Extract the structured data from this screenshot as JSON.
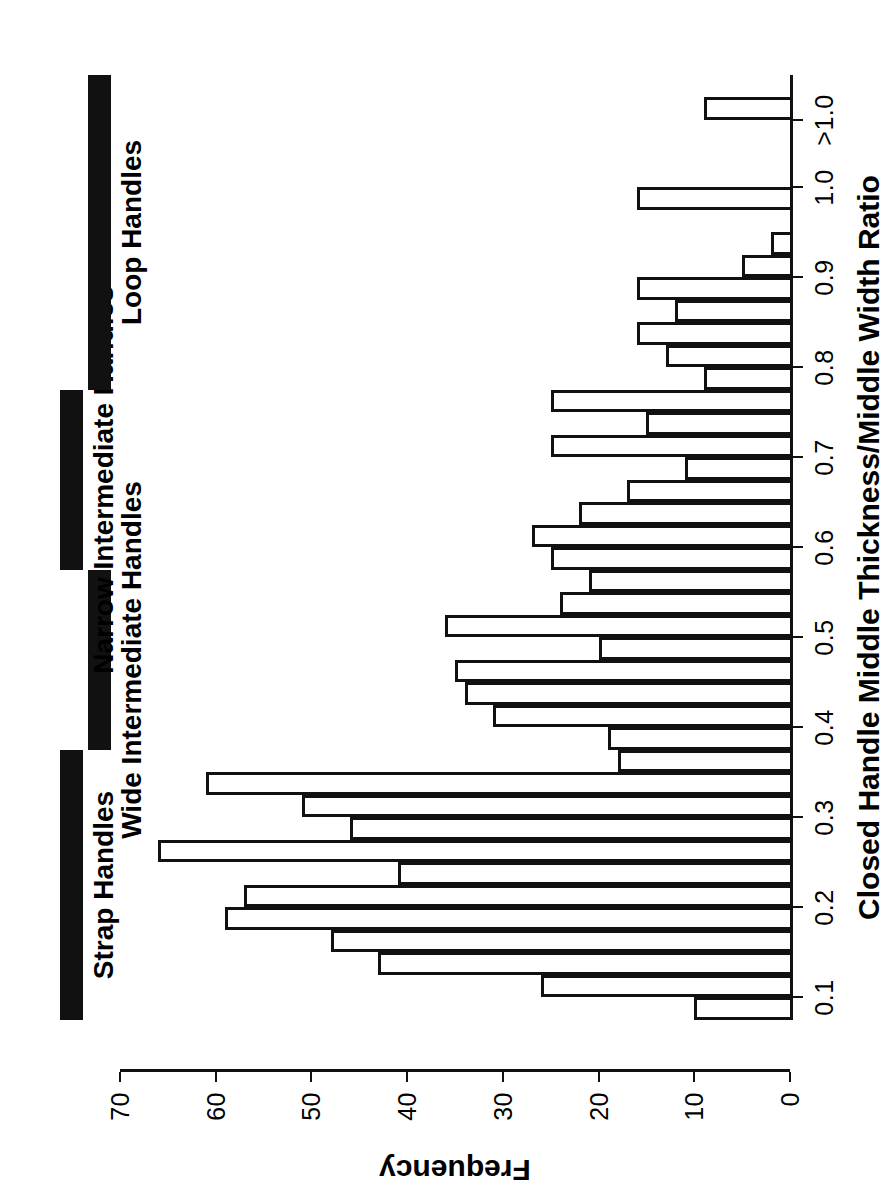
{
  "figure": {
    "kind": "histogram",
    "orientation": "rotated-90-ccw"
  },
  "axes": {
    "x_title": "Closed Handle Middle Thickness/Middle Width Ratio",
    "y_title": "Frequency",
    "x_ticks": [
      "0.1",
      "0.2",
      "0.3",
      "0.4",
      "0.5",
      "0.6",
      "0.7",
      "0.8",
      "0.9",
      "1.0",
      ">1.0"
    ],
    "y_ticks": [
      "0",
      "10",
      "20",
      "30",
      "40",
      "50",
      "60",
      "70"
    ]
  },
  "bands": [
    {
      "label": "Strap Handles"
    },
    {
      "label": "Wide Intermediate Handles"
    },
    {
      "label": "Narrow Intermediate Handles"
    },
    {
      "label": "Loop Handles"
    }
  ],
  "chart_data": {
    "type": "bar",
    "title": "",
    "xlabel": "Closed Handle Middle Thickness/Middle Width Ratio",
    "ylabel": "Frequency",
    "xlim": [
      0.075,
      1.125
    ],
    "ylim": [
      0,
      70
    ],
    "grid": false,
    "legend": null,
    "bin_width": 0.025,
    "bin_starts": [
      0.075,
      0.1,
      0.125,
      0.15,
      0.175,
      0.2,
      0.225,
      0.25,
      0.275,
      0.3,
      0.325,
      0.35,
      0.375,
      0.4,
      0.425,
      0.45,
      0.475,
      0.5,
      0.525,
      0.55,
      0.575,
      0.6,
      0.625,
      0.65,
      0.675,
      0.7,
      0.725,
      0.75,
      0.775,
      0.8,
      0.825,
      0.85,
      0.875,
      0.9,
      0.925,
      0.975,
      1.075
    ],
    "categories": [
      "0.075-0.100",
      "0.100-0.125",
      "0.125-0.150",
      "0.150-0.175",
      "0.175-0.200",
      "0.200-0.225",
      "0.225-0.250",
      "0.250-0.275",
      "0.275-0.300",
      "0.300-0.325",
      "0.325-0.350",
      "0.350-0.375",
      "0.375-0.400",
      "0.400-0.425",
      "0.425-0.450",
      "0.450-0.475",
      "0.475-0.500",
      "0.500-0.525",
      "0.525-0.550",
      "0.550-0.575",
      "0.575-0.600",
      "0.600-0.625",
      "0.625-0.650",
      "0.650-0.675",
      "0.675-0.700",
      "0.700-0.725",
      "0.725-0.750",
      "0.750-0.775",
      "0.775-0.800",
      "0.800-0.825",
      "0.825-0.850",
      "0.850-0.875",
      "0.875-0.900",
      "0.900-0.925",
      "0.925-0.950",
      "1.0",
      ">1.0"
    ],
    "values": [
      10,
      26,
      43,
      48,
      59,
      57,
      41,
      66,
      46,
      51,
      61,
      18,
      19,
      31,
      34,
      35,
      20,
      36,
      24,
      21,
      25,
      27,
      22,
      17,
      11,
      25,
      15,
      25,
      9,
      13,
      16,
      12,
      16,
      5,
      2,
      16,
      9
    ],
    "annotations": [
      {
        "text": "Strap Handles",
        "span": [
          0.075,
          0.375
        ]
      },
      {
        "text": "Wide Intermediate Handles",
        "span": [
          0.375,
          0.575
        ]
      },
      {
        "text": "Narrow Intermediate Handles",
        "span": [
          0.575,
          0.775
        ]
      },
      {
        "text": "Loop Handles",
        "span": [
          0.775,
          1.125
        ]
      }
    ]
  }
}
